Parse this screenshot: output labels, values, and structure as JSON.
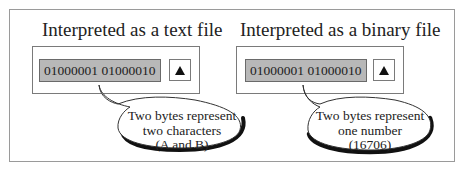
{
  "left": {
    "title": "Interpreted as a text file",
    "field_value": "01000001 01000010",
    "button_icon": "triangle-up-icon",
    "callout": {
      "line1": "Two bytes represent",
      "line2": "two characters",
      "line3": "(A and B)"
    }
  },
  "right": {
    "title": "Interpreted as a binary file",
    "field_value": "01000001 01000010",
    "button_icon": "triangle-up-icon",
    "callout": {
      "line1": "Two bytes represent",
      "line2": "one number",
      "line3": "(16706)"
    }
  }
}
